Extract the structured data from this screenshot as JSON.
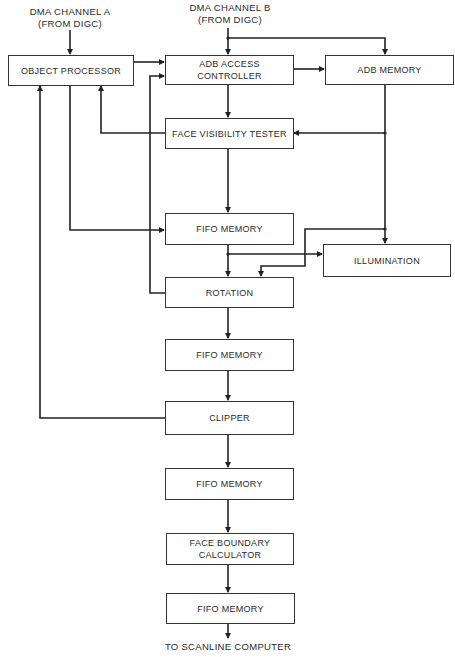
{
  "inputs": {
    "channel_a": {
      "line1": "DMA CHANNEL A",
      "line2": "(FROM DIGC)"
    },
    "channel_b": {
      "line1": "DMA CHANNEL B",
      "line2": "(FROM DIGC)"
    }
  },
  "blocks": {
    "object_processor": "OBJECT PROCESSOR",
    "adb_access_controller": "ADB ACCESS CONTROLLER",
    "adb_memory": "ADB MEMORY",
    "face_visibility_tester": "FACE VISIBILITY TESTER",
    "fifo_memory_1": "FIFO MEMORY",
    "illumination": "ILLUMINATION",
    "rotation": "ROTATION",
    "fifo_memory_2": "FIFO MEMORY",
    "clipper": "CLIPPER",
    "fifo_memory_3": "FIFO MEMORY",
    "face_boundary_calculator": {
      "line1": "FACE BOUNDARY",
      "line2": "CALCULATOR"
    },
    "fifo_memory_4": "FIFO MEMORY"
  },
  "output": {
    "label": "TO SCANLINE COMPUTER"
  },
  "colors": {
    "line": "#222222",
    "box_border": "#333333",
    "background": "#ffffff"
  }
}
